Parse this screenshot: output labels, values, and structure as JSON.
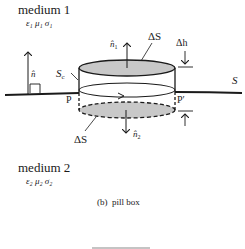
{
  "diagram": {
    "caption": "(b)  pill box",
    "media": [
      {
        "name": "medium 1",
        "params": "ε₁  μ₁  σ₁"
      },
      {
        "name": "medium 2",
        "params": "ε₂  μ₂  σ₂"
      }
    ],
    "labels": {
      "surface": "S",
      "contour_surface": "S",
      "contour_subscript": "c",
      "normal": "n̂",
      "normal_top": "n̂",
      "normal_top_sub": "1",
      "normal_bottom": "n̂",
      "normal_bottom_sub": "2",
      "delta_s_top": "ΔS",
      "delta_s_bottom": "ΔS",
      "delta_h": "Δh",
      "point_p": "P",
      "point_p_prime": "P′"
    },
    "colors": {
      "stroke": "#1a1a1a",
      "fill_gray": "#c8c8c8",
      "faint_line": "#b0b0b0"
    }
  }
}
